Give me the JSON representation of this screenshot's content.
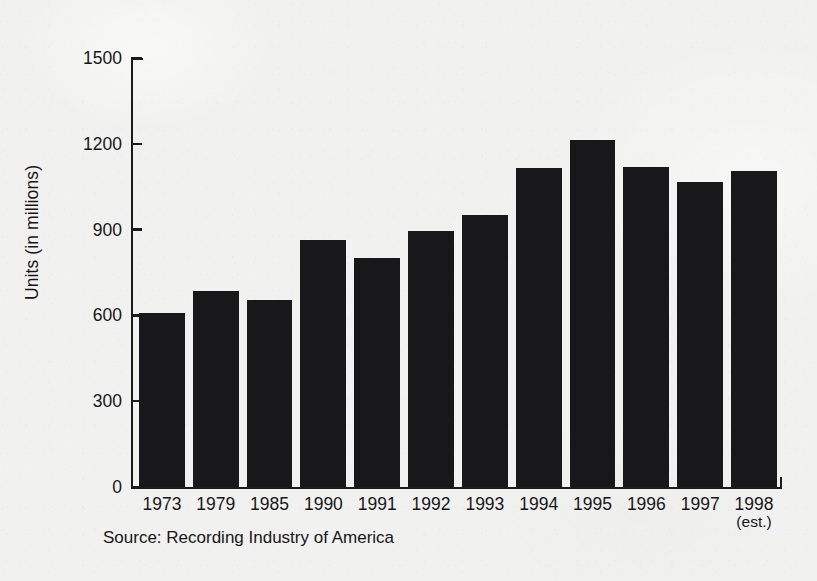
{
  "chart_data": {
    "type": "bar",
    "title": "",
    "subtitle": "",
    "xlabel": "",
    "ylabel": "Units (in millions)",
    "categories": [
      "1973",
      "1979",
      "1985",
      "1990",
      "1991",
      "1992",
      "1993",
      "1994",
      "1995",
      "1996",
      "1997",
      "1998"
    ],
    "category_sublabels": [
      "",
      "",
      "",
      "",
      "",
      "",
      "",
      "",
      "",
      "",
      "",
      "(est.)"
    ],
    "values": [
      610,
      685,
      655,
      865,
      800,
      895,
      950,
      1115,
      1215,
      1120,
      1065,
      1105
    ],
    "ylim": [
      0,
      1500
    ],
    "ytick_labels": [
      "1500",
      "1200",
      "900",
      "600",
      "300",
      "0"
    ],
    "ytick_values": [
      1500,
      1200,
      900,
      600,
      300,
      0
    ],
    "grid": false,
    "legend": null,
    "legend_position": "none",
    "bar_color": "#18181a",
    "background_color": "#f1f1ef",
    "axis_color": "#1b1b1e",
    "text_color": "#17171a",
    "source_note": "Source: Recording Industry of America"
  },
  "axis": {
    "y_title": "Units (in millions)"
  },
  "footer": {
    "source": "Source: Recording Industry of America"
  }
}
